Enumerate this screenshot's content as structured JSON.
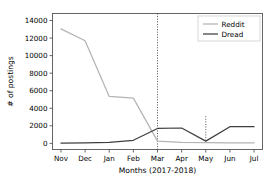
{
  "chart_data": {
    "type": "line",
    "title": "",
    "xlabel": "Months (2017-2018)",
    "ylabel": "# of postings",
    "categories": [
      "Nov",
      "Dec",
      "Jan",
      "Feb",
      "Mar",
      "Apr",
      "May",
      "Jun",
      "Jul"
    ],
    "xtick_labels": [
      "Nov",
      "Dec",
      "Jan",
      "Feb",
      "Mar",
      "Apr",
      "May",
      "Jun",
      "Jul"
    ],
    "ytick_labels": [
      "0",
      "2000",
      "4000",
      "6000",
      "8000",
      "10000",
      "12000",
      "14000"
    ],
    "ytick_values": [
      0,
      2000,
      4000,
      6000,
      8000,
      10000,
      12000,
      14000
    ],
    "ylim": [
      -700,
      14800
    ],
    "xlim": [
      -0.35,
      8.35
    ],
    "grid": false,
    "legend_position": "upper right",
    "series": [
      {
        "name": "Reddit",
        "color": "#b4b4b4",
        "values": [
          13050,
          11700,
          5350,
          5150,
          250,
          100,
          80,
          60,
          50
        ]
      },
      {
        "name": "Dread",
        "color": "#3f3f3f",
        "values": [
          30,
          60,
          110,
          350,
          1700,
          1750,
          250,
          1900,
          1900
        ]
      }
    ],
    "annotations": [
      {
        "name": "mar-marker",
        "type": "vline",
        "x_category": "Mar",
        "style": "dotted",
        "color": "#3f3f3f",
        "y_from": -700,
        "y_to": 14800
      },
      {
        "name": "may-marker",
        "type": "vline",
        "x_category": "May",
        "style": "dotted",
        "color": "#3f3f3f",
        "y_from": 250,
        "y_to": 3100
      }
    ]
  },
  "legend": {
    "entries": [
      {
        "label": "Reddit"
      },
      {
        "label": "Dread"
      }
    ]
  },
  "axes": {
    "x_title": "Months (2017-2018)",
    "y_title": "# of postings"
  }
}
